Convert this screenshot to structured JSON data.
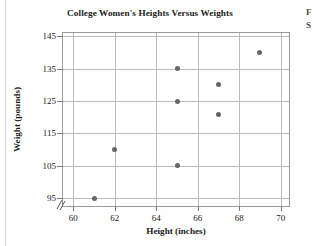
{
  "figure": {
    "side_caption_lines": [
      "F",
      "S"
    ]
  },
  "chart_data": {
    "type": "scatter",
    "title": "College Women's Heights Versus Weights",
    "xlabel": "Height (inches)",
    "ylabel": "Weight (pounds)",
    "xlim": [
      59.5,
      70.5
    ],
    "ylim": [
      92,
      146
    ],
    "xticks": [
      60,
      62,
      64,
      66,
      68,
      70
    ],
    "yticks": [
      95,
      105,
      115,
      125,
      135,
      145
    ],
    "xtick_labels": [
      "60",
      "62",
      "64",
      "66",
      "68",
      "70"
    ],
    "ytick_labels": [
      "95",
      "105",
      "115",
      "125",
      "135",
      "145"
    ],
    "grid": true,
    "legend": "none",
    "axis_break": "y-axis break below 95",
    "marker_color": "#666666",
    "grid_color": "#b9b9b9",
    "points": [
      {
        "x": 61,
        "y": 95
      },
      {
        "x": 62,
        "y": 110
      },
      {
        "x": 65,
        "y": 105
      },
      {
        "x": 65,
        "y": 125
      },
      {
        "x": 65,
        "y": 135
      },
      {
        "x": 67,
        "y": 121
      },
      {
        "x": 67,
        "y": 130
      },
      {
        "x": 69,
        "y": 140
      }
    ]
  }
}
